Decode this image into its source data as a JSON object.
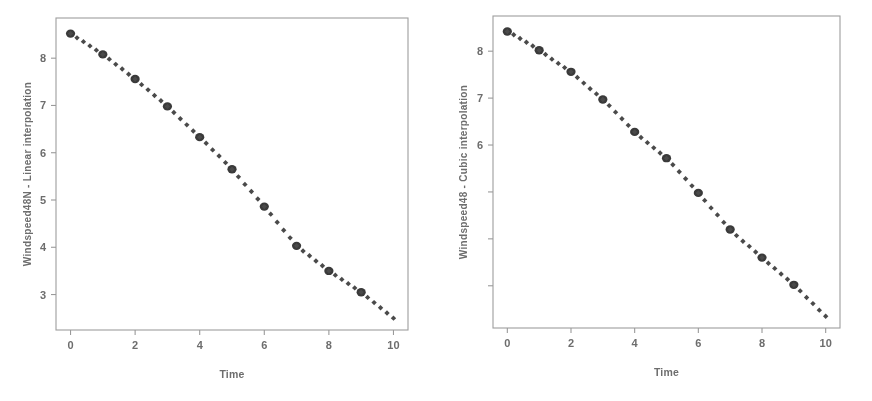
{
  "figure": {
    "background_color": "#ffffff",
    "ink_color": "#4a4a4a",
    "axis_color": "#9a9a9a"
  },
  "panels": [
    {
      "id": "left-panel",
      "y_axis_title": "Windspeed48N - Linear interpolation",
      "x_axis_title": "Time"
    },
    {
      "id": "right-panel",
      "y_axis_title": "Windspeed48 - Cubic interpolation",
      "x_axis_title": "Time"
    }
  ],
  "chart_data": [
    {
      "type": "scatter",
      "title": "",
      "xlabel": "Time",
      "ylabel": "Windspeed48N - Linear interpolation",
      "xlim": [
        -0.45,
        10.45
      ],
      "ylim": [
        2.25,
        8.85
      ],
      "xticks": [
        0,
        2,
        4,
        6,
        8,
        10
      ],
      "xtick_labels": [
        "0",
        "2",
        "4",
        "6",
        "8",
        "10"
      ],
      "yticks": [
        3,
        4,
        5,
        6,
        7,
        8
      ],
      "ytick_labels": [
        "3",
        "4",
        "5",
        "6",
        "7",
        "8"
      ],
      "grid": false,
      "legend": false,
      "series": [
        {
          "name": "observed",
          "marker": "filled-circle-large",
          "x": [
            0,
            1,
            2,
            3,
            4,
            5,
            6,
            7,
            8,
            9
          ],
          "values": [
            8.52,
            8.08,
            7.56,
            6.98,
            6.33,
            5.65,
            4.86,
            4.03,
            3.5,
            3.05
          ]
        },
        {
          "name": "linear interpolation",
          "marker": "filled-dot-small",
          "x": [
            0.0,
            0.2,
            0.4,
            0.6,
            0.8,
            1.0,
            1.2,
            1.4,
            1.6,
            1.8,
            2.0,
            2.2,
            2.4,
            2.6,
            2.8,
            3.0,
            3.2,
            3.4,
            3.6,
            3.8,
            4.0,
            4.2,
            4.4,
            4.6,
            4.8,
            5.0,
            5.2,
            5.4,
            5.6,
            5.8,
            6.0,
            6.2,
            6.4,
            6.6,
            6.8,
            7.0,
            7.2,
            7.4,
            7.6,
            7.8,
            8.0,
            8.2,
            8.4,
            8.6,
            8.8,
            9.0,
            9.2,
            9.4,
            9.6,
            9.8,
            10.0
          ],
          "values": [
            8.52,
            8.43,
            8.35,
            8.26,
            8.17,
            8.08,
            7.98,
            7.87,
            7.77,
            7.66,
            7.56,
            7.44,
            7.33,
            7.21,
            7.1,
            6.98,
            6.85,
            6.72,
            6.59,
            6.46,
            6.33,
            6.2,
            6.06,
            5.93,
            5.79,
            5.65,
            5.49,
            5.33,
            5.18,
            5.02,
            4.86,
            4.7,
            4.53,
            4.36,
            4.2,
            4.03,
            3.92,
            3.82,
            3.71,
            3.61,
            3.5,
            3.41,
            3.32,
            3.23,
            3.14,
            3.05,
            2.94,
            2.83,
            2.72,
            2.61,
            2.5
          ]
        }
      ]
    },
    {
      "type": "scatter",
      "title": "",
      "xlabel": "Time",
      "ylabel": "Windspeed48 - Cubic interpolation",
      "xlim": [
        -0.45,
        10.45
      ],
      "ylim": [
        2.1,
        8.75
      ],
      "xticks": [
        0,
        2,
        4,
        6,
        8,
        10
      ],
      "xtick_labels": [
        "0",
        "2",
        "4",
        "6",
        "8",
        "10"
      ],
      "yticks": [
        3,
        4,
        5,
        6,
        7,
        8
      ],
      "ytick_labels": [
        "",
        "",
        "",
        "6",
        "7",
        "8"
      ],
      "grid": false,
      "legend": false,
      "series": [
        {
          "name": "observed",
          "marker": "filled-circle-large",
          "x": [
            0,
            1,
            2,
            3,
            4,
            5,
            6,
            7,
            8,
            9
          ],
          "values": [
            8.42,
            8.02,
            7.56,
            6.97,
            6.28,
            5.72,
            4.98,
            4.2,
            3.6,
            3.02
          ]
        },
        {
          "name": "cubic interpolation",
          "marker": "filled-dot-small",
          "x": [
            0.0,
            0.2,
            0.4,
            0.6,
            0.8,
            1.0,
            1.2,
            1.4,
            1.6,
            1.8,
            2.0,
            2.2,
            2.4,
            2.6,
            2.8,
            3.0,
            3.2,
            3.4,
            3.6,
            3.8,
            4.0,
            4.2,
            4.4,
            4.6,
            4.8,
            5.0,
            5.2,
            5.4,
            5.6,
            5.8,
            6.0,
            6.2,
            6.4,
            6.6,
            6.8,
            7.0,
            7.2,
            7.4,
            7.6,
            7.8,
            8.0,
            8.2,
            8.4,
            8.6,
            8.8,
            9.0,
            9.2,
            9.4,
            9.6,
            9.8,
            10.0
          ],
          "values": [
            8.42,
            8.35,
            8.27,
            8.19,
            8.11,
            8.02,
            7.93,
            7.83,
            7.74,
            7.65,
            7.56,
            7.44,
            7.32,
            7.2,
            7.09,
            6.97,
            6.84,
            6.7,
            6.56,
            6.42,
            6.28,
            6.16,
            6.05,
            5.94,
            5.83,
            5.72,
            5.58,
            5.43,
            5.28,
            5.13,
            4.98,
            4.82,
            4.66,
            4.51,
            4.35,
            4.2,
            4.07,
            3.95,
            3.84,
            3.72,
            3.6,
            3.48,
            3.37,
            3.25,
            3.14,
            3.02,
            2.89,
            2.75,
            2.62,
            2.48,
            2.35
          ]
        }
      ]
    }
  ]
}
